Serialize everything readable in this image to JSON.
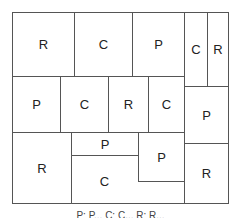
{
  "diagram": {
    "cells": [
      {
        "id": "r1a",
        "label": "R"
      },
      {
        "id": "r1b",
        "label": "C"
      },
      {
        "id": "r1c",
        "label": "P"
      },
      {
        "id": "r1d",
        "label": "C"
      },
      {
        "id": "r1e",
        "label": "R"
      },
      {
        "id": "r2a",
        "label": "P"
      },
      {
        "id": "r2b",
        "label": "C"
      },
      {
        "id": "r2c",
        "label": "R"
      },
      {
        "id": "r2d",
        "label": "C"
      },
      {
        "id": "r2e",
        "label": "P"
      },
      {
        "id": "r3a",
        "label": "R"
      },
      {
        "id": "r3b",
        "label": "P"
      },
      {
        "id": "r3c",
        "label": "C"
      },
      {
        "id": "r3d",
        "label": "P"
      },
      {
        "id": "r3e",
        "label": "R"
      }
    ],
    "legend": "P: P...     C: C...     R: R..."
  }
}
